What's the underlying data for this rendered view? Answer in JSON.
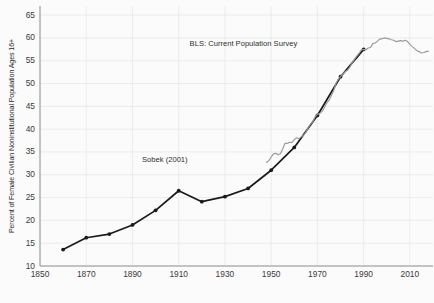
{
  "chart_data": {
    "type": "line",
    "title": "",
    "xlabel": "",
    "ylabel": "Percent of Female Civilian Noninstitutional Population Ages 16+",
    "xlim": [
      1850,
      2020
    ],
    "ylim": [
      10,
      67
    ],
    "grid": true,
    "legend_position": "none",
    "xticks": [
      "1850",
      "1870",
      "1890",
      "1910",
      "1930",
      "1950",
      "1970",
      "1990",
      "2010"
    ],
    "yticks": [
      "10",
      "15",
      "20",
      "25",
      "30",
      "35",
      "40",
      "45",
      "50",
      "55",
      "60",
      "65"
    ],
    "annotations": [
      {
        "text": "BLS: Current Population Survey",
        "x": 1938,
        "y": 58.6
      },
      {
        "text": "Sobek (2001)",
        "x": 1904,
        "y": 33.2
      }
    ],
    "series": [
      {
        "name": "Sobek (2001)",
        "color": "#1a1a1a",
        "marker": "circle",
        "x": [
          1860,
          1870,
          1880,
          1890,
          1900,
          1910,
          1920,
          1930,
          1940,
          1950,
          1960,
          1970,
          1980,
          1990
        ],
        "values": [
          13.6,
          16.2,
          17.0,
          19.0,
          22.2,
          26.5,
          24.1,
          25.2,
          27.0,
          31.0,
          36.0,
          43.0,
          51.5,
          57.5
        ]
      },
      {
        "name": "BLS: Current Population Survey",
        "color": "#9a9a9a",
        "marker": "none",
        "x": [
          1948,
          1949,
          1950,
          1951,
          1952,
          1953,
          1954,
          1955,
          1956,
          1957,
          1958,
          1959,
          1960,
          1961,
          1962,
          1963,
          1964,
          1965,
          1966,
          1967,
          1968,
          1969,
          1970,
          1971,
          1972,
          1973,
          1974,
          1975,
          1976,
          1977,
          1978,
          1979,
          1980,
          1981,
          1982,
          1983,
          1984,
          1985,
          1986,
          1987,
          1988,
          1989,
          1990,
          1991,
          1992,
          1993,
          1994,
          1995,
          1996,
          1997,
          1998,
          1999,
          2000,
          2001,
          2002,
          2003,
          2004,
          2005,
          2006,
          2007,
          2008,
          2009,
          2010,
          2011,
          2012,
          2013,
          2014,
          2015,
          2016,
          2017,
          2018
        ],
        "values": [
          32.7,
          33.1,
          33.9,
          34.6,
          34.7,
          34.4,
          34.6,
          35.7,
          36.9,
          36.9,
          37.1,
          37.1,
          37.7,
          38.1,
          37.9,
          38.3,
          38.7,
          39.3,
          40.3,
          41.1,
          41.6,
          42.7,
          43.3,
          43.4,
          43.9,
          44.7,
          45.7,
          46.3,
          47.3,
          48.4,
          50.0,
          50.9,
          51.5,
          52.1,
          52.6,
          52.9,
          53.6,
          54.5,
          55.3,
          56.0,
          56.6,
          57.4,
          57.5,
          57.4,
          57.8,
          57.9,
          58.8,
          58.9,
          59.3,
          59.8,
          59.8,
          60.0,
          59.9,
          59.8,
          59.6,
          59.5,
          59.2,
          59.3,
          59.4,
          59.3,
          59.5,
          59.2,
          58.6,
          58.1,
          57.7,
          57.2,
          57.0,
          56.7,
          56.8,
          57.0,
          57.1
        ]
      }
    ]
  }
}
